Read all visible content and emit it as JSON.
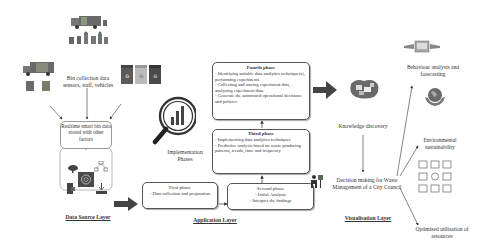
{
  "diagram": {
    "data_source": {
      "bin_collection_label": "Bin collection data sensors, staff, vehicles",
      "realtime_label": "Realtime smart bin data stored with other factors",
      "layer_title": "Data Source Layer",
      "icons": [
        "garbage-truck-icon",
        "workers-icon",
        "truck-icon",
        "bins-icon",
        "recycling-bins-icon",
        "cloud-icon",
        "network-icon",
        "database-icon",
        "mobile-icon",
        "download-icon"
      ]
    },
    "application": {
      "implementation_label": "Implementation Phases",
      "layer_title": "Application Layer",
      "phases": {
        "first": {
          "title": "First phase",
          "body": "- Data collection and preparation"
        },
        "second": {
          "title": "Second phase",
          "lines": [
            "- Initial Analysis",
            "- Interpret the findings"
          ]
        },
        "third": {
          "title": "Third phase",
          "lines": [
            "- Implementing data analytics techniques",
            "- Predictive analysis based on waste producing patterns, trends, time and frequency"
          ]
        },
        "fourth": {
          "title": "Fourth phase",
          "lines": [
            "- Identifying suitable data analytics technique(s), performing experiments",
            "- Collecting and storing experiment data, analysing experiment data",
            "- Generate the automated operational decisions and policies"
          ]
        }
      }
    },
    "visualization": {
      "knowledge_label": "Knowledge discovery",
      "decision_label": "Decision making for Waste Management of a City Council",
      "layer_title": "Visualisation Layer"
    },
    "outcomes": {
      "behaviour": "Behaviour analysis and forecasting",
      "environment": "Environmental sustainability",
      "resources": "Optimised utilisation of resources"
    },
    "colors": {
      "arrow": "#444444",
      "box_border": "#555555",
      "icon_gray": "#666666",
      "icon_green": "#5a7a5a"
    }
  }
}
